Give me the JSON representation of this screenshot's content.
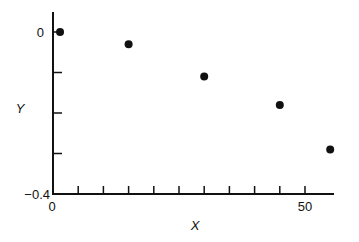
{
  "chart_data": {
    "type": "scatter",
    "title": "",
    "xlabel": "X",
    "ylabel": "Y",
    "xlim": [
      0,
      55.8
    ],
    "ylim": [
      -0.4,
      0.05
    ],
    "grid": false,
    "legend": null,
    "x_ticks": [
      0,
      5,
      10,
      15,
      20,
      25,
      30,
      35,
      40,
      45,
      50
    ],
    "x_tick_labels": [
      {
        "value": 0,
        "label": "0"
      },
      {
        "value": 50,
        "label": "50"
      }
    ],
    "y_ticks": [
      0,
      -0.1,
      -0.2,
      -0.3,
      -0.4
    ],
    "y_tick_labels": [
      {
        "value": 0,
        "label": "0"
      },
      {
        "value": -0.4,
        "label": "-0.4"
      }
    ],
    "series": [
      {
        "name": "data",
        "marker": "filled-circle",
        "color": "#111111",
        "points": [
          {
            "x": 1,
            "y": 0.0
          },
          {
            "x": 15,
            "y": -0.03
          },
          {
            "x": 30,
            "y": -0.11
          },
          {
            "x": 45,
            "y": -0.18
          },
          {
            "x": 55,
            "y": -0.29
          }
        ]
      }
    ]
  },
  "labels": {
    "x_axis": "X",
    "y_axis": "Y",
    "x_origin": "0",
    "x_max": "50",
    "y_top": "0",
    "y_bottom": "−0.4"
  }
}
